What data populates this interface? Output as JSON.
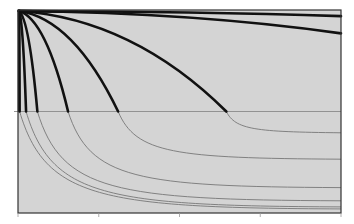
{
  "chart_data": {
    "type": "line",
    "title": "",
    "xlabel": "",
    "ylabel": "",
    "grid": false,
    "legend": null,
    "plot_background": "#d4d4d4",
    "axis_color": "#333333",
    "reference_line": {
      "y_fraction": 0.5,
      "color": "#8a8a8a"
    },
    "x_ticks": [
      0,
      0.25,
      0.5,
      0.75,
      1.0
    ],
    "x_tick_labels": [],
    "y_tick_labels": [],
    "xlim": [
      0,
      1
    ],
    "ylim": [
      0,
      1
    ],
    "upper_series_note": "Thick black curves fanning from top-left origin, reaching the midline at increasing x",
    "upper_series": [
      {
        "name": "curve-1",
        "end_x": 0.005,
        "end_y": 0.5,
        "color": "#111111",
        "width": 2.6
      },
      {
        "name": "curve-2",
        "end_x": 0.025,
        "end_y": 0.5,
        "color": "#111111",
        "width": 2.6
      },
      {
        "name": "curve-3",
        "end_x": 0.06,
        "end_y": 0.5,
        "color": "#111111",
        "width": 2.6
      },
      {
        "name": "curve-4",
        "end_x": 0.155,
        "end_y": 0.5,
        "color": "#111111",
        "width": 2.6
      },
      {
        "name": "curve-5",
        "end_x": 0.31,
        "end_y": 0.5,
        "color": "#111111",
        "width": 2.6
      },
      {
        "name": "curve-6",
        "end_x": 0.645,
        "end_y": 0.5,
        "color": "#111111",
        "width": 2.6
      },
      {
        "name": "curve-7",
        "end_x": 1.0,
        "end_y": 0.115,
        "color": "#111111",
        "width": 2.6
      },
      {
        "name": "curve-8",
        "end_x": 1.0,
        "end_y": 0.03,
        "color": "#111111",
        "width": 2.6
      }
    ],
    "lower_series_note": "Thin gray decay continuations below the midline",
    "lower_series": [
      {
        "name": "tail-1",
        "start_x": 0.005,
        "asymptote_y": 0.975,
        "color": "#777777"
      },
      {
        "name": "tail-2",
        "start_x": 0.025,
        "asymptote_y": 0.965,
        "color": "#777777"
      },
      {
        "name": "tail-3",
        "start_x": 0.06,
        "asymptote_y": 0.935,
        "color": "#777777"
      },
      {
        "name": "tail-4",
        "start_x": 0.155,
        "asymptote_y": 0.87,
        "color": "#777777"
      },
      {
        "name": "tail-5",
        "start_x": 0.31,
        "asymptote_y": 0.73,
        "color": "#777777"
      },
      {
        "name": "tail-6",
        "start_x": 0.645,
        "asymptote_y": 0.6,
        "color": "#777777"
      }
    ]
  }
}
